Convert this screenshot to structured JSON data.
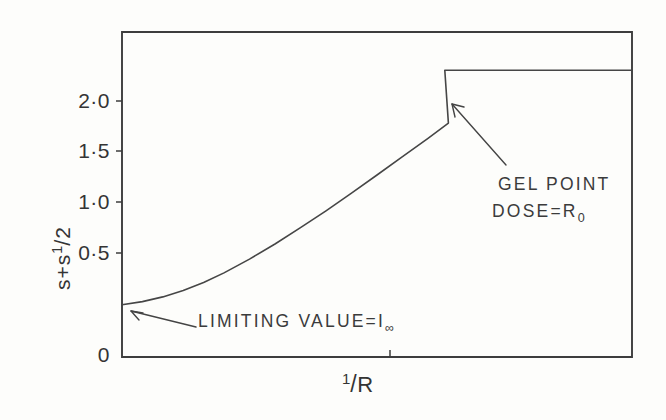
{
  "figure": {
    "name": "gel-point-dose-curve",
    "background_color": "#fdfdfb",
    "ink_color": "#3a3a3a"
  },
  "chart_data": {
    "type": "line",
    "title": "",
    "subtitle": "",
    "xlabel": "1/R",
    "ylabel": "s + s1/2",
    "ylabel_parts": {
      "first": "s",
      "plus": "+",
      "second": "s",
      "exponent_numerator": "1",
      "exponent_slash": "/",
      "exponent_denominator": "2"
    },
    "xlabel_parts": {
      "numerator": "1",
      "slash": "/",
      "denominator": "R"
    },
    "ylim": [
      0,
      2.3
    ],
    "xlim": [
      0,
      1
    ],
    "grid": false,
    "legend": false,
    "y_ticks": [
      {
        "value": 2.0,
        "label": "2·0"
      },
      {
        "value": 1.5,
        "label": "1·5"
      },
      {
        "value": 1.0,
        "label": "1·0"
      },
      {
        "value": 0.5,
        "label": "0·5"
      },
      {
        "value": 0.0,
        "label": "0"
      }
    ],
    "x_ticks": [
      {
        "value": 0.525,
        "label": ""
      }
    ],
    "series": [
      {
        "name": "s + s^1/2 vs 1/R",
        "comment": "convex rising branch up to the gel point, then horizontal plateau",
        "points": [
          [
            0.0,
            0.37
          ],
          [
            0.04,
            0.392
          ],
          [
            0.08,
            0.425
          ],
          [
            0.12,
            0.47
          ],
          [
            0.16,
            0.527
          ],
          [
            0.2,
            0.595
          ],
          [
            0.25,
            0.693
          ],
          [
            0.3,
            0.8
          ],
          [
            0.35,
            0.915
          ],
          [
            0.4,
            1.035
          ],
          [
            0.45,
            1.16
          ],
          [
            0.5,
            1.288
          ],
          [
            0.55,
            1.418
          ],
          [
            0.6,
            1.548
          ],
          [
            0.64,
            1.655
          ],
          [
            0.633,
            2.03
          ],
          [
            1.0,
            2.03
          ]
        ],
        "gel_point": [
          0.633,
          2.03
        ],
        "limiting_value": 0.37,
        "plateau_value": 2.03
      }
    ],
    "annotations": [
      {
        "id": "limiting-value",
        "line1": "LIMITING VALUE=I",
        "subscript1": "∞",
        "text_x": 198,
        "text_y": 322,
        "arrow_from": [
          196,
          327
        ],
        "arrow_to": [
          128,
          312
        ]
      },
      {
        "id": "gel-point",
        "line1": "GEL POINT",
        "line2": "DOSE=R",
        "subscript2": "0",
        "text_x": 492,
        "text_y": 183,
        "arrow_from": [
          506,
          165
        ],
        "arrow_to": [
          452,
          104
        ]
      }
    ]
  },
  "axes": {
    "frame": {
      "left": 122,
      "top": 32,
      "right": 632,
      "bottom": 357
    }
  }
}
